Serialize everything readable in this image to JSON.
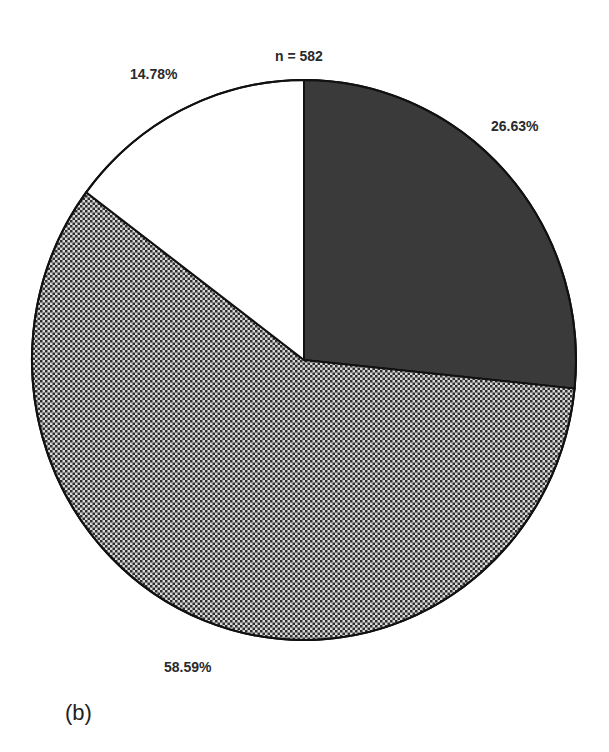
{
  "chart_data": {
    "type": "pie",
    "title": "",
    "annotation": "n = 582",
    "panel_label": "(b)",
    "start_angle_deg": 0,
    "direction": "clockwise",
    "slices": [
      {
        "label": "26.63%",
        "value": 26.63,
        "fill": "dark",
        "color": "#3a3a3a"
      },
      {
        "label": "58.59%",
        "value": 58.59,
        "fill": "checker",
        "color": "#8a8a8a"
      },
      {
        "label": "14.78%",
        "value": 14.78,
        "fill": "white",
        "color": "#ffffff"
      }
    ],
    "legend": []
  },
  "labels": {
    "n": "n = 582",
    "slice_0": "26.63%",
    "slice_1": "58.59%",
    "slice_2": "14.78%",
    "panel": "(b)"
  }
}
